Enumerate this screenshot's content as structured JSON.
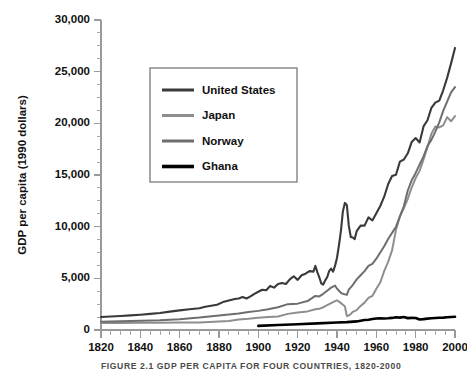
{
  "figure": {
    "caption": "FIGURE 2.1   GDP PER CAPITA FOR FOUR COUNTRIES, 1820-2000"
  },
  "chart_data": {
    "type": "line",
    "title": "",
    "xlabel": "",
    "ylabel": "GDP per capita (1990 dollars)",
    "xlim": [
      1820,
      2000
    ],
    "ylim": [
      0,
      30000
    ],
    "grid": false,
    "legend_position": "upper-left-inset",
    "y_ticks": [
      0,
      5000,
      10000,
      15000,
      20000,
      25000,
      30000
    ],
    "y_tick_labels": [
      "0",
      "5,000",
      "10,000",
      "15,000",
      "20,000",
      "25,000",
      "30,000"
    ],
    "y_minor_step": 1250,
    "x_ticks": [
      1820,
      1840,
      1860,
      1880,
      1900,
      1920,
      1940,
      1960,
      1980,
      2000
    ],
    "x_tick_labels": [
      "1820",
      "1840",
      "1860",
      "1880",
      "1900",
      "1920",
      "1940",
      "1960",
      "1980",
      "2000"
    ],
    "x_minor_step": 5,
    "series": [
      {
        "name": "United States",
        "color": "#3a3a3a",
        "width": 2.1,
        "x": [
          1820,
          1825,
          1830,
          1835,
          1840,
          1845,
          1850,
          1855,
          1860,
          1865,
          1870,
          1873,
          1876,
          1879,
          1882,
          1885,
          1888,
          1890,
          1892,
          1894,
          1896,
          1898,
          1900,
          1902,
          1904,
          1906,
          1908,
          1910,
          1912,
          1914,
          1916,
          1918,
          1920,
          1922,
          1924,
          1926,
          1928,
          1929,
          1930,
          1931,
          1932,
          1933,
          1934,
          1935,
          1936,
          1937,
          1938,
          1939,
          1940,
          1941,
          1942,
          1943,
          1944,
          1945,
          1946,
          1947,
          1948,
          1949,
          1950,
          1952,
          1954,
          1956,
          1958,
          1960,
          1962,
          1964,
          1966,
          1968,
          1970,
          1972,
          1974,
          1976,
          1978,
          1980,
          1982,
          1984,
          1986,
          1988,
          1990,
          1992,
          1994,
          1996,
          1998,
          2000
        ],
        "y": [
          1257,
          1300,
          1350,
          1420,
          1480,
          1560,
          1650,
          1780,
          1900,
          2000,
          2100,
          2250,
          2350,
          2450,
          2700,
          2850,
          3000,
          3050,
          3200,
          3050,
          3250,
          3500,
          3700,
          3900,
          3850,
          4250,
          4100,
          4450,
          4550,
          4450,
          4900,
          5200,
          4850,
          5300,
          5450,
          5700,
          5650,
          6200,
          5600,
          5100,
          4500,
          4400,
          4800,
          5100,
          5700,
          5950,
          5650,
          6200,
          7000,
          8200,
          9600,
          11500,
          12300,
          12100,
          10100,
          9000,
          8950,
          8800,
          9560,
          10100,
          10100,
          10900,
          10600,
          11300,
          12000,
          12900,
          14100,
          14900,
          15030,
          16300,
          16500,
          17100,
          18200,
          18580,
          18150,
          19700,
          20300,
          21500,
          22000,
          22200,
          23200,
          24400,
          25800,
          27300
        ]
      },
      {
        "name": "Norway",
        "color": "#6e6e6e",
        "width": 2.0,
        "x": [
          1820,
          1830,
          1840,
          1850,
          1860,
          1870,
          1875,
          1880,
          1885,
          1890,
          1895,
          1900,
          1905,
          1910,
          1915,
          1920,
          1925,
          1929,
          1931,
          1933,
          1935,
          1937,
          1939,
          1940,
          1941,
          1942,
          1943,
          1944,
          1945,
          1946,
          1948,
          1950,
          1952,
          1954,
          1956,
          1958,
          1960,
          1962,
          1964,
          1966,
          1968,
          1970,
          1972,
          1974,
          1976,
          1978,
          1980,
          1982,
          1984,
          1986,
          1988,
          1990,
          1992,
          1994,
          1996,
          1998,
          2000
        ],
        "y": [
          801,
          850,
          900,
          950,
          1050,
          1200,
          1300,
          1400,
          1500,
          1600,
          1750,
          1850,
          2000,
          2200,
          2500,
          2550,
          2800,
          3300,
          3250,
          3500,
          3800,
          4100,
          4300,
          4000,
          3800,
          3600,
          3500,
          3450,
          3400,
          3900,
          4350,
          4900,
          5300,
          5700,
          6200,
          6400,
          6900,
          7500,
          8100,
          8800,
          9400,
          10000,
          11000,
          12000,
          13500,
          14500,
          15200,
          16000,
          16800,
          17800,
          18400,
          19200,
          20100,
          21200,
          22100,
          23000,
          23500
        ]
      },
      {
        "name": "Japan",
        "color": "#8e8e8e",
        "width": 2.0,
        "x": [
          1820,
          1830,
          1840,
          1850,
          1860,
          1870,
          1875,
          1880,
          1885,
          1890,
          1895,
          1900,
          1905,
          1910,
          1915,
          1920,
          1925,
          1929,
          1931,
          1933,
          1935,
          1937,
          1939,
          1940,
          1941,
          1942,
          1943,
          1944,
          1945,
          1946,
          1947,
          1948,
          1950,
          1952,
          1954,
          1956,
          1958,
          1960,
          1962,
          1964,
          1966,
          1968,
          1970,
          1972,
          1974,
          1976,
          1978,
          1980,
          1982,
          1984,
          1986,
          1988,
          1990,
          1992,
          1994,
          1996,
          1998,
          2000
        ],
        "y": [
          669,
          680,
          690,
          700,
          720,
          737,
          780,
          830,
          880,
          1010,
          1080,
          1180,
          1250,
          1300,
          1560,
          1700,
          1800,
          2000,
          2050,
          2200,
          2400,
          2600,
          2800,
          2870,
          2750,
          2600,
          2450,
          2300,
          1350,
          1400,
          1550,
          1750,
          1920,
          2330,
          2650,
          3100,
          3300,
          3990,
          4600,
          5700,
          6600,
          7700,
          9710,
          11000,
          11800,
          12700,
          13800,
          14700,
          15400,
          16500,
          17700,
          19000,
          19700,
          19600,
          19800,
          20600,
          20200,
          20700
        ]
      },
      {
        "name": "Ghana",
        "color": "#000000",
        "width": 2.6,
        "x": [
          1900,
          1910,
          1920,
          1930,
          1940,
          1945,
          1950,
          1952,
          1954,
          1956,
          1958,
          1960,
          1962,
          1964,
          1966,
          1968,
          1970,
          1972,
          1974,
          1976,
          1978,
          1980,
          1982,
          1984,
          1986,
          1988,
          1990,
          1992,
          1994,
          1996,
          1998,
          2000
        ],
        "y": [
          400,
          480,
          560,
          640,
          720,
          760,
          830,
          900,
          960,
          1000,
          1060,
          1120,
          1140,
          1120,
          1130,
          1170,
          1230,
          1200,
          1250,
          1150,
          1170,
          1160,
          1010,
          1050,
          1100,
          1130,
          1160,
          1180,
          1200,
          1230,
          1260,
          1280
        ]
      }
    ]
  },
  "legend": {
    "entries": [
      {
        "label": "United States",
        "color": "#3a3a3a",
        "width": 3.0
      },
      {
        "label": "Japan",
        "color": "#8e8e8e",
        "width": 3.0
      },
      {
        "label": "Norway",
        "color": "#6e6e6e",
        "width": 3.0
      },
      {
        "label": "Ghana",
        "color": "#000000",
        "width": 3.6
      }
    ]
  }
}
